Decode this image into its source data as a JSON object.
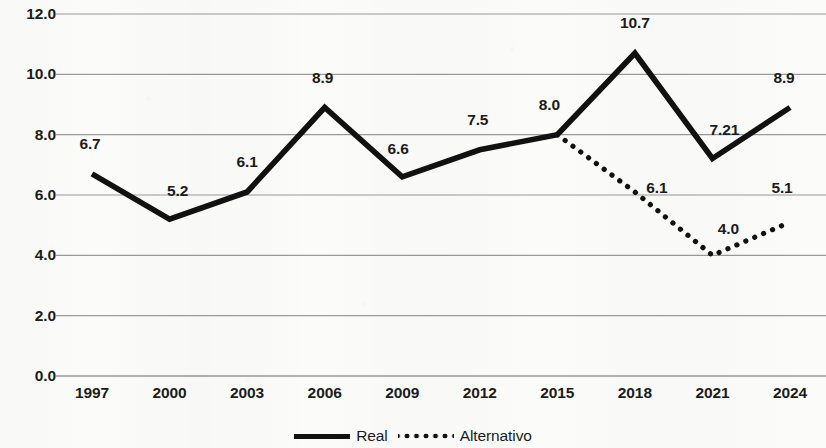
{
  "chart_data": {
    "type": "line",
    "title": "",
    "subtitle": "",
    "xlabel": "",
    "ylabel": "",
    "categories": [
      "1997",
      "2000",
      "2003",
      "2006",
      "2009",
      "2012",
      "2015",
      "2018",
      "2021",
      "2024"
    ],
    "ylim": [
      0.0,
      12.0
    ],
    "ytick_labels": [
      "12.0",
      "10.0",
      "8.0",
      "6.0",
      "4.0",
      "2.0",
      "0.0"
    ],
    "ytick_values": [
      12.0,
      10.0,
      8.0,
      6.0,
      4.0,
      2.0,
      0.0
    ],
    "grid": "horizontal",
    "legend_position": "bottom-center",
    "series": [
      {
        "name": "Real",
        "style": "solid",
        "color": "#111111",
        "x": [
          "1997",
          "2000",
          "2003",
          "2006",
          "2009",
          "2012",
          "2015",
          "2018",
          "2021",
          "2024"
        ],
        "values": [
          6.7,
          5.2,
          6.1,
          8.9,
          6.6,
          7.5,
          8.0,
          10.7,
          7.21,
          8.9
        ],
        "data_labels": [
          "6.7",
          "5.2",
          "6.1",
          "8.9",
          "6.6",
          "7.5",
          "8.0",
          "10.7",
          "7.21",
          "8.9"
        ]
      },
      {
        "name": "Alternativo",
        "style": "dotted",
        "color": "#111111",
        "x": [
          "2015",
          "2018",
          "2021",
          "2024"
        ],
        "values": [
          8.0,
          6.1,
          4.0,
          5.1
        ],
        "data_labels": [
          "",
          "6.1",
          "4.0",
          "5.1"
        ]
      }
    ]
  },
  "y_axis": {
    "ticks": [
      {
        "label": "12.0",
        "value": 12.0
      },
      {
        "label": "10.0",
        "value": 10.0
      },
      {
        "label": "8.0",
        "value": 8.0
      },
      {
        "label": "6.0",
        "value": 6.0
      },
      {
        "label": "4.0",
        "value": 4.0
      },
      {
        "label": "2.0",
        "value": 2.0
      },
      {
        "label": "0.0",
        "value": 0.0
      }
    ]
  },
  "x_axis": {
    "ticks": [
      {
        "label": "1997"
      },
      {
        "label": "2000"
      },
      {
        "label": "2003"
      },
      {
        "label": "2006"
      },
      {
        "label": "2009"
      },
      {
        "label": "2012"
      },
      {
        "label": "2015"
      },
      {
        "label": "2018"
      },
      {
        "label": "2021"
      },
      {
        "label": "2024"
      }
    ]
  },
  "point_labels": [
    {
      "text": "6.7",
      "series": "Real",
      "category": "1997",
      "value": 6.7
    },
    {
      "text": "5.2",
      "series": "Real",
      "category": "2000",
      "value": 5.2
    },
    {
      "text": "6.1",
      "series": "Real",
      "category": "2003",
      "value": 6.1
    },
    {
      "text": "8.9",
      "series": "Real",
      "category": "2006",
      "value": 8.9
    },
    {
      "text": "6.6",
      "series": "Real",
      "category": "2009",
      "value": 6.6
    },
    {
      "text": "7.5",
      "series": "Real",
      "category": "2012",
      "value": 7.5
    },
    {
      "text": "8.0",
      "series": "Real",
      "category": "2015",
      "value": 8.0
    },
    {
      "text": "10.7",
      "series": "Real",
      "category": "2018",
      "value": 10.7
    },
    {
      "text": "7.21",
      "series": "Real",
      "category": "2021",
      "value": 7.21
    },
    {
      "text": "8.9",
      "series": "Real",
      "category": "2024",
      "value": 8.9
    },
    {
      "text": "6.1",
      "series": "Alternativo",
      "category": "2018",
      "value": 6.1
    },
    {
      "text": "4.0",
      "series": "Alternativo",
      "category": "2021",
      "value": 4.0
    },
    {
      "text": "5.1",
      "series": "Alternativo",
      "category": "2024",
      "value": 5.1
    }
  ],
  "legend": {
    "items": [
      {
        "label": "Real",
        "style": "solid",
        "color": "#111111"
      },
      {
        "label": "Alternativo",
        "style": "dotted",
        "color": "#111111"
      }
    ]
  },
  "colors": {
    "series_line": "#111111",
    "gridline": "#9a9a9a",
    "text": "#1c1c1c",
    "background": "#fbfbfa"
  }
}
